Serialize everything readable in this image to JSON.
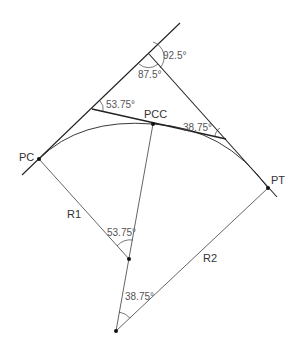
{
  "diagram": {
    "type": "compound-curve",
    "points": {
      "PC": {
        "label": "PC",
        "x": 39,
        "y": 159
      },
      "PCC": {
        "label": "PCC",
        "x": 153,
        "y": 124
      },
      "PT": {
        "label": "PT",
        "x": 268,
        "y": 188
      },
      "O1": {
        "x": 129,
        "y": 259
      },
      "O2": {
        "x": 116,
        "y": 331
      },
      "PI": {
        "x": 149,
        "y": 54
      },
      "V1": {
        "x": 92,
        "y": 109
      },
      "V2": {
        "x": 226,
        "y": 139
      }
    },
    "radii": {
      "R1": "R1",
      "R2": "R2"
    },
    "angles": {
      "exterior_PI": "92.5°",
      "interior_PI": "87.5°",
      "at_V1": "53.75°",
      "at_V2": "38.75°",
      "central_1": "53.75°",
      "central_2": "38.75°"
    },
    "colors": {
      "line": "#222222",
      "text": "#333333"
    }
  }
}
